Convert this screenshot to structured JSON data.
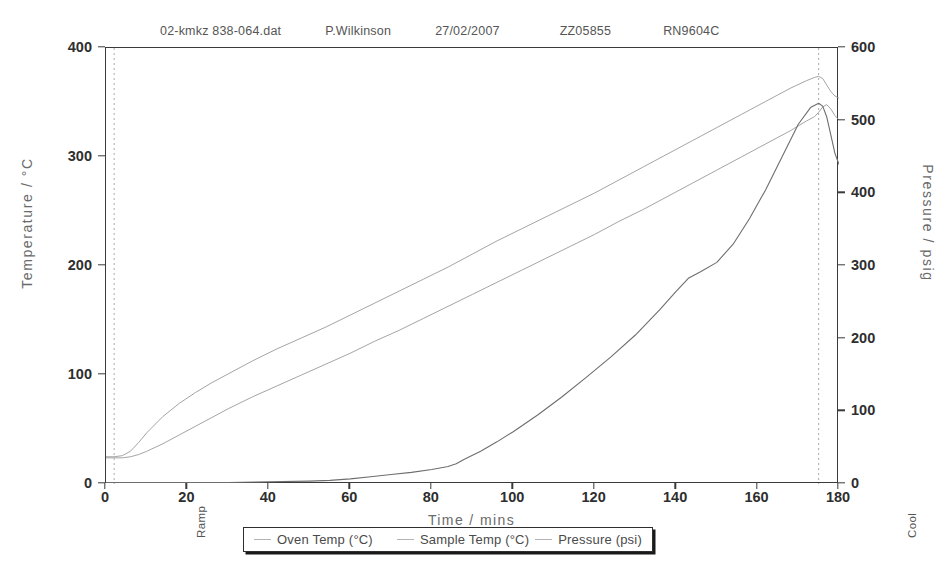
{
  "header": {
    "file": "02-kmkz 838-064.dat",
    "author": "P.Wilkinson",
    "date": "27/02/2007",
    "code1": "ZZ05855",
    "code2": "RN9604C"
  },
  "annotations": {
    "ramp": "Ramp",
    "cool": "Cool"
  },
  "chart_data": {
    "type": "line",
    "title": "",
    "xlabel": "Time  /  mins",
    "ylabel": "Temperature  /  °C",
    "ylabel_right": "Pressure  /  psig",
    "xlim": [
      0,
      180
    ],
    "ylim": [
      0,
      400
    ],
    "ylim_right": [
      0,
      600
    ],
    "xticks": [
      0,
      20,
      40,
      60,
      80,
      100,
      120,
      140,
      160,
      180
    ],
    "yticks": [
      0,
      100,
      200,
      300,
      400
    ],
    "yticks_right": [
      0,
      100,
      200,
      300,
      400,
      500,
      600
    ],
    "grid": false,
    "legend_position": "bottom",
    "annotation_lines": [
      {
        "label": "Ramp",
        "x": 2,
        "style": "dotted"
      },
      {
        "label": "Cool",
        "x": 175,
        "style": "dotted"
      }
    ],
    "series": [
      {
        "name": "Oven Temp (°C)",
        "axis": "left",
        "color": "#9a9a9a",
        "x": [
          0,
          2,
          4,
          6,
          8,
          10,
          14,
          18,
          22,
          26,
          30,
          36,
          42,
          48,
          54,
          60,
          66,
          72,
          78,
          84,
          90,
          96,
          102,
          108,
          114,
          120,
          126,
          132,
          138,
          144,
          150,
          156,
          162,
          168,
          172,
          174,
          175,
          176,
          177,
          178,
          179,
          180
        ],
        "y": [
          25,
          25,
          26,
          30,
          38,
          47,
          62,
          74,
          84,
          93,
          101,
          113,
          124,
          134,
          144,
          155,
          166,
          177,
          188,
          199,
          211,
          223,
          234,
          245,
          256,
          267,
          279,
          291,
          303,
          315,
          327,
          339,
          351,
          363,
          370,
          373,
          374,
          372,
          366,
          360,
          356,
          354
        ]
      },
      {
        "name": "Sample Temp (°C)",
        "axis": "left",
        "color": "#9a9a9a",
        "x": [
          0,
          2,
          4,
          6,
          8,
          10,
          14,
          18,
          22,
          26,
          30,
          36,
          42,
          48,
          54,
          60,
          66,
          72,
          78,
          84,
          90,
          96,
          102,
          108,
          114,
          120,
          126,
          132,
          138,
          144,
          150,
          156,
          162,
          168,
          172,
          174,
          175,
          176,
          177,
          178,
          179,
          180
        ],
        "y": [
          24,
          24,
          24,
          25,
          27,
          30,
          37,
          45,
          53,
          61,
          69,
          80,
          90,
          100,
          110,
          120,
          131,
          141,
          152,
          163,
          174,
          185,
          196,
          207,
          218,
          229,
          241,
          252,
          264,
          276,
          288,
          300,
          312,
          324,
          333,
          337,
          341,
          346,
          348,
          344,
          338,
          334
        ]
      },
      {
        "name": "Pressure (psi)",
        "axis": "right",
        "color": "#6e6e6e",
        "x": [
          0,
          10,
          20,
          30,
          40,
          50,
          55,
          60,
          65,
          70,
          75,
          80,
          84,
          86,
          88,
          92,
          96,
          100,
          106,
          112,
          118,
          124,
          130,
          136,
          140,
          143,
          146,
          150,
          154,
          158,
          162,
          166,
          170,
          173,
          175,
          176,
          177,
          178,
          179,
          180
        ],
        "y": [
          2,
          2,
          2,
          2,
          3,
          4,
          5,
          7,
          10,
          13,
          16,
          20,
          24,
          28,
          34,
          45,
          58,
          72,
          95,
          120,
          147,
          175,
          205,
          240,
          265,
          283,
          292,
          305,
          330,
          365,
          405,
          450,
          495,
          518,
          524,
          520,
          505,
          480,
          455,
          440
        ]
      }
    ]
  }
}
